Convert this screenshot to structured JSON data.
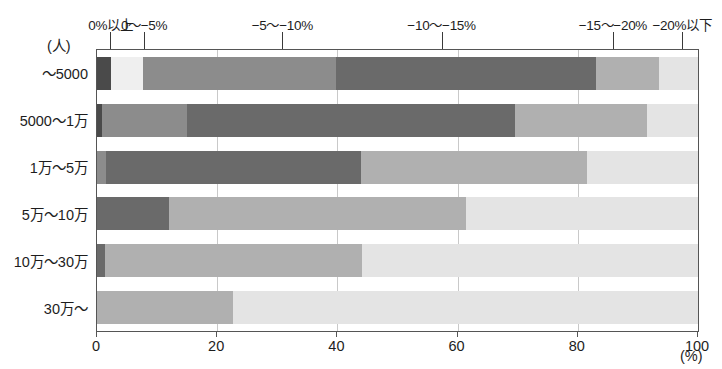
{
  "chart_data": {
    "type": "bar",
    "orientation": "horizontal",
    "stacked": true,
    "stacked_percent": true,
    "title": "",
    "subtitle": "",
    "xlabel": "(%)",
    "ylabel": "(人)",
    "xlim": [
      0,
      100
    ],
    "grid": true,
    "legend_position": "top",
    "xticks": [
      {
        "value": 0,
        "label": "0"
      },
      {
        "value": 20,
        "label": "20"
      },
      {
        "value": 40,
        "label": "40"
      },
      {
        "value": 60,
        "label": "60"
      },
      {
        "value": 80,
        "label": "80"
      },
      {
        "value": 100,
        "label": "100"
      }
    ],
    "categories": [
      "～5000",
      "5000～1万",
      "1万～5万",
      "5万～10万",
      "10万～30万",
      "30万～"
    ],
    "series": [
      {
        "name": "0%以上",
        "color": "#4a4a4a",
        "legend_x": 2.4,
        "values": [
          2.4,
          0.8,
          1.5,
          0.0,
          1.3,
          0.0
        ]
      },
      {
        "name": "0～−5%",
        "color": "#eeeeee",
        "legend_x": 8.0,
        "values": [
          5.9,
          0.0,
          0.0,
          0.0,
          0.0,
          0.0
        ]
      },
      {
        "name": "−5～−10%",
        "color": "#8c8c8c",
        "legend_x": 31.0,
        "values": [
          31.5,
          14.2,
          0.0,
          0.0,
          0.0,
          0.0
        ]
      },
      {
        "name": "−10～−15%",
        "color": "#6a6a6a",
        "legend_x": 57.5,
        "values": [
          43.3,
          54.5,
          42.5,
          12.0,
          0.0,
          0.0
        ]
      },
      {
        "name": "−15～−20%",
        "color": "#b0b0b0",
        "legend_x": 86.0,
        "values": [
          10.4,
          22.0,
          37.5,
          49.4,
          42.8,
          22.6
        ]
      },
      {
        "name": "−20%以下",
        "color": "#e2e2e2",
        "legend_x": 97.5,
        "values": [
          6.5,
          8.5,
          18.5,
          38.6,
          55.9,
          77.4
        ]
      }
    ],
    "legend_labels": [
      "0%以上",
      "0～−5%",
      "−5～−10%",
      "−10～−15%",
      "−15～−20%",
      "−20%以下"
    ],
    "row_segments": [
      [
        {
          "label": "0%以上",
          "start": 0.0,
          "end": 2.4,
          "color": "#4a4a4a"
        },
        {
          "label": "0～−5%",
          "start": 2.4,
          "end": 7.7,
          "color": "#efefef"
        },
        {
          "label": "−5～−10%",
          "start": 7.7,
          "end": 39.8,
          "color": "#8c8c8c"
        },
        {
          "label": "−10～−15%",
          "start": 39.8,
          "end": 83.0,
          "color": "#6a6a6a"
        },
        {
          "label": "−15～−20%",
          "start": 83.0,
          "end": 93.5,
          "color": "#b0b0b0"
        },
        {
          "label": "−20%以下",
          "start": 93.5,
          "end": 100.0,
          "color": "#e4e4e4"
        }
      ],
      [
        {
          "label": "0%以上",
          "start": 0.0,
          "end": 0.8,
          "color": "#4a4a4a"
        },
        {
          "label": "−5～−10%",
          "start": 0.8,
          "end": 15.0,
          "color": "#8c8c8c"
        },
        {
          "label": "−10～−15%",
          "start": 15.0,
          "end": 69.5,
          "color": "#6a6a6a"
        },
        {
          "label": "−15～−20%",
          "start": 69.5,
          "end": 91.5,
          "color": "#b0b0b0"
        },
        {
          "label": "−20%以下",
          "start": 91.5,
          "end": 100.0,
          "color": "#e4e4e4"
        }
      ],
      [
        {
          "label": "0%以上",
          "start": 0.0,
          "end": 1.5,
          "color": "#8c8c8c"
        },
        {
          "label": "−10～−15%",
          "start": 1.5,
          "end": 44.0,
          "color": "#6a6a6a"
        },
        {
          "label": "−15～−20%",
          "start": 44.0,
          "end": 81.5,
          "color": "#b0b0b0"
        },
        {
          "label": "−20%以下",
          "start": 81.5,
          "end": 100.0,
          "color": "#e4e4e4"
        }
      ],
      [
        {
          "label": "−10～−15%",
          "start": 0.0,
          "end": 12.0,
          "color": "#6a6a6a"
        },
        {
          "label": "−15～−20%",
          "start": 12.0,
          "end": 61.4,
          "color": "#b0b0b0"
        },
        {
          "label": "−20%以下",
          "start": 61.4,
          "end": 100.0,
          "color": "#e4e4e4"
        }
      ],
      [
        {
          "label": "0%以上",
          "start": 0.0,
          "end": 1.3,
          "color": "#6a6a6a"
        },
        {
          "label": "−15～−20%",
          "start": 1.3,
          "end": 44.1,
          "color": "#b0b0b0"
        },
        {
          "label": "−20%以下",
          "start": 44.1,
          "end": 100.0,
          "color": "#e4e4e4"
        }
      ],
      [
        {
          "label": "−15～−20%",
          "start": 0.0,
          "end": 22.6,
          "color": "#b0b0b0"
        },
        {
          "label": "−20%以下",
          "start": 22.6,
          "end": 100.0,
          "color": "#e4e4e4"
        }
      ]
    ]
  }
}
